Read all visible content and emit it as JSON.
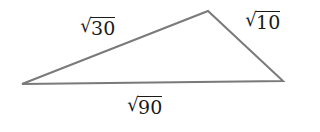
{
  "diagram": {
    "type": "triangle",
    "stroke_color": "#7a7a7a",
    "vertices": {
      "left": [
        22,
        84
      ],
      "top": [
        208,
        11
      ],
      "right": [
        283,
        81
      ]
    },
    "sides": [
      {
        "id": "left-top",
        "radical": "√",
        "value": "30"
      },
      {
        "id": "top-right",
        "radical": "√",
        "value": "10"
      },
      {
        "id": "bottom",
        "radical": "√",
        "value": "90"
      }
    ]
  }
}
